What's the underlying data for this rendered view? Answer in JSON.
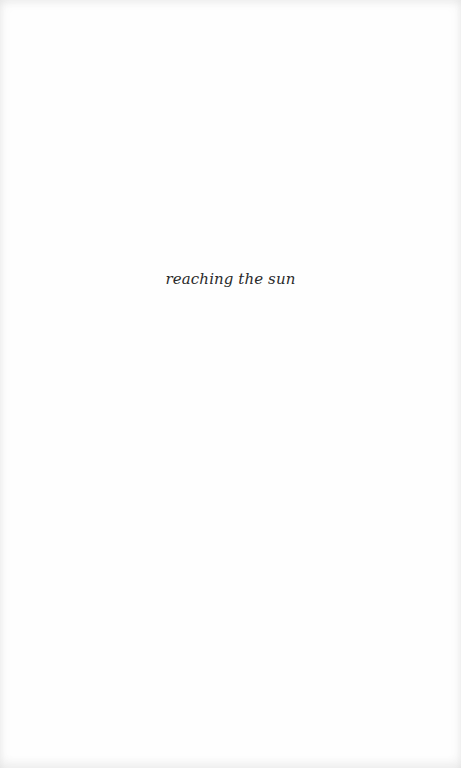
{
  "page": {
    "epigraph": "reaching the sun",
    "background_color": "#fefefe",
    "text_color": "#2a2a2a"
  }
}
